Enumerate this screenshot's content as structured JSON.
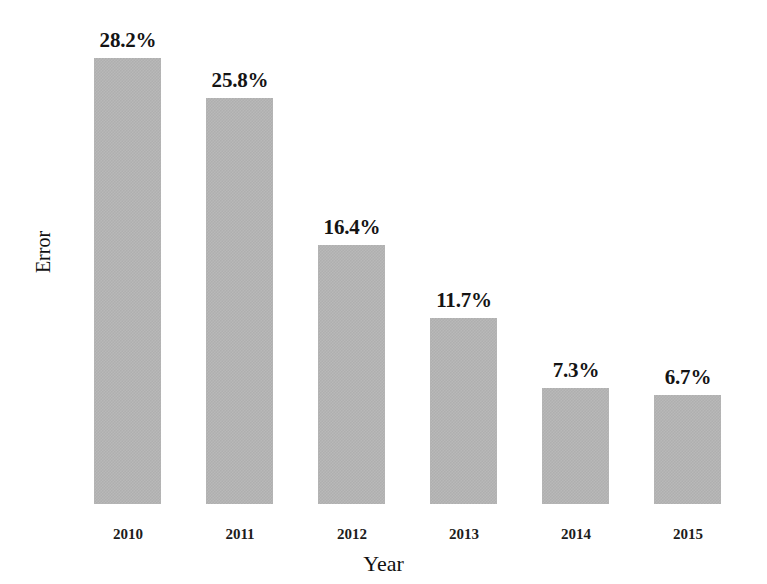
{
  "chart_data": {
    "type": "bar",
    "title": "",
    "subtitle": "",
    "xlabel": "Year",
    "ylabel": "Error",
    "categories": [
      "2010",
      "2011",
      "2012",
      "2013",
      "2014",
      "2015"
    ],
    "values": [
      28.2,
      25.8,
      16.4,
      11.7,
      7.3,
      6.7
    ],
    "data_labels": [
      "28.2%",
      "25.8%",
      "16.4%",
      "11.7%",
      "7.3%",
      "6.7%"
    ],
    "bar_color": "#b5b5b5",
    "background_color": "#ffffff",
    "text_color": "#141414",
    "grid": false,
    "legend": null,
    "legend_position": "none",
    "y_axis_ticks": [],
    "ylim": [
      0,
      30
    ],
    "series": [
      {
        "name": "Error",
        "values": [
          28.2,
          25.8,
          16.4,
          11.7,
          7.3,
          6.7
        ]
      }
    ],
    "bar_geometry": {
      "baseline_y": 504,
      "bar_width": 67,
      "bar_pitch": 112,
      "first_bar_left": 94,
      "bar_tops": [
        58,
        98,
        245,
        318,
        388,
        395
      ]
    }
  }
}
